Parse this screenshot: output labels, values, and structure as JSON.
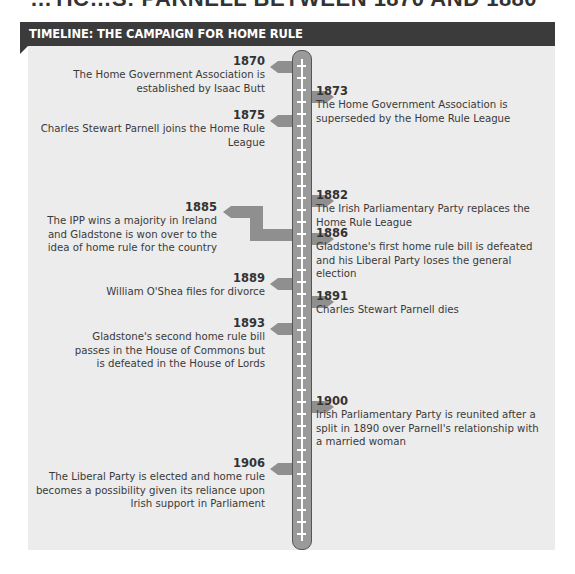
{
  "page_heading_fragment": "…TIC…S: PARNELL BETWEEN 1870 AND 1880",
  "panel": {
    "title": "TIMELINE: THE CAMPAIGN FOR HOME RULE",
    "accent_bar_color": "#3b3b3b",
    "background_color": "#ececec"
  },
  "events": [
    {
      "side": "left",
      "year": "1870",
      "text": "The Home Government Association is established by Isaac Butt"
    },
    {
      "side": "right",
      "year": "1873",
      "text": "The Home Government Association is superseded by the Home Rule League"
    },
    {
      "side": "left",
      "year": "1875",
      "text": "Charles Stewart Parnell joins the Home Rule League"
    },
    {
      "side": "right",
      "year": "1882",
      "text": "The Irish Parliamentary Party replaces the Home Rule League"
    },
    {
      "side": "left",
      "year": "1885",
      "text": "The IPP wins a majority in Ireland and Gladstone is won over to the idea of home rule for the country"
    },
    {
      "side": "right",
      "year": "1886",
      "text": "Gladstone's first home rule bill is defeated and his Liberal Party loses the general election"
    },
    {
      "side": "left",
      "year": "1889",
      "text": "William O'Shea files for divorce"
    },
    {
      "side": "right",
      "year": "1891",
      "text": "Charles Stewart Parnell dies"
    },
    {
      "side": "left",
      "year": "1893",
      "text": "Gladstone's second home rule bill passes in the House of Commons but is defeated in the House of Lords"
    },
    {
      "side": "right",
      "year": "1900",
      "text": "Irish Parliamentary Party is reunited after a split in 1890 over Parnell's relationship with a married woman"
    },
    {
      "side": "left",
      "year": "1906",
      "text": "The Liberal Party is elected and home rule becomes a possibility given its reliance upon Irish support in Parliament"
    }
  ]
}
